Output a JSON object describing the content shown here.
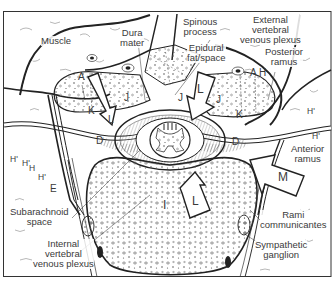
{
  "figure": {
    "type": "anatomical cross-section, lumbar vertebra (axial view)",
    "labels": {
      "muscle": "Muscle",
      "dura_mater": [
        "Dura",
        "mater"
      ],
      "spinous_process": [
        "Spinous",
        "process"
      ],
      "epidural_fat_space": [
        "Epidural",
        "fat/space"
      ],
      "external_vertebral_venous_plexus": [
        "External",
        "vertebral",
        "venous plexus"
      ],
      "posterior_ramus": [
        "Posterior",
        "ramus"
      ],
      "anterior_ramus": [
        "Anterior",
        "ramus"
      ],
      "subarachnoid_space": [
        "Subarachnoid",
        "space"
      ],
      "internal_vertebral_venous_plexus": [
        "Internal",
        "vertebral",
        "venous plexus"
      ],
      "rami_communicantes": [
        "Rami",
        "communicantes"
      ],
      "sympathetic_ganglion": [
        "Sympathetic",
        "ganglion"
      ]
    },
    "letter_markers": {
      "A_left": "A",
      "A_right": "A",
      "H_right": "H",
      "J_left": "J",
      "J_center": "J",
      "J_right": "J",
      "K_left": "K",
      "K_right": "K",
      "L_left_arrow": "L",
      "L_top_arrow": "L",
      "L_bottom_arrow": "L",
      "M_arrow": "M",
      "I_body": "I",
      "E": "E",
      "D_left": "D",
      "D_right": "D",
      "H_prime_1": "H'",
      "H_prime_2": "H'",
      "H_left": "H",
      "H_prime_3": "H'",
      "H_prime_right_1": "H'",
      "H_prime_right_2": "H'"
    },
    "colors": {
      "ink": "#1a1a1a",
      "label_text": "#3a3a3a",
      "stipple": "#555555",
      "background": "#ffffff"
    }
  }
}
